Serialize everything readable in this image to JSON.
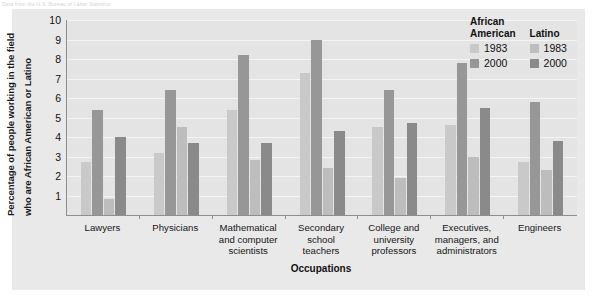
{
  "top_note": "Data from the U.S. Bureau of Labor Statistics",
  "chart_data": {
    "type": "bar",
    "title": "",
    "xlabel": "Occupations",
    "ylabel": "Percentage of people working in the field who are African American or Latino",
    "ylabel_line1": "Percentage of people working in the field",
    "ylabel_line2": "who are African American or Latino",
    "ylim": [
      0,
      10
    ],
    "yticks": [
      10,
      9,
      8,
      7,
      6,
      5,
      4,
      3,
      2,
      1
    ],
    "grid": true,
    "legend_position": "top-right",
    "categories": [
      "Lawyers",
      "Physicians",
      "Mathematical and computer scientists",
      "Secondary school teachers",
      "College and university professors",
      "Executives, managers, and administrators",
      "Engineers"
    ],
    "category_lines": [
      [
        "Lawyers"
      ],
      [
        "Physicians"
      ],
      [
        "Mathematical",
        "and computer",
        "scientists"
      ],
      [
        "Secondary",
        "school",
        "teachers"
      ],
      [
        "College and",
        "university",
        "professors"
      ],
      [
        "Executives,",
        "managers, and",
        "administrators"
      ],
      [
        "Engineers"
      ]
    ],
    "series": [
      {
        "name": "African American 1983",
        "group": "African American",
        "year": "1983",
        "color": "#c9c9c9",
        "values": [
          2.7,
          3.2,
          5.4,
          7.3,
          4.5,
          4.6,
          2.7
        ]
      },
      {
        "name": "African American 2000",
        "group": "African American",
        "year": "2000",
        "color": "#979797",
        "values": [
          5.4,
          6.4,
          8.2,
          9.0,
          6.4,
          7.8,
          5.8
        ]
      },
      {
        "name": "Latino 1983",
        "group": "Latino",
        "year": "1983",
        "color": "#bdbdbd",
        "values": [
          0.8,
          4.5,
          2.8,
          2.4,
          1.9,
          3.0,
          2.3
        ]
      },
      {
        "name": "Latino 2000",
        "group": "Latino",
        "year": "2000",
        "color": "#8a8a8a",
        "values": [
          4.0,
          3.7,
          3.7,
          4.3,
          4.7,
          5.5,
          3.8
        ]
      }
    ]
  },
  "legend": {
    "columns": [
      {
        "header_line1": "African",
        "header_line2": "American",
        "entries": [
          {
            "label": "1983",
            "color": "#c9c9c9"
          },
          {
            "label": "2000",
            "color": "#979797"
          }
        ]
      },
      {
        "header_line1": "",
        "header_line2": "Latino",
        "entries": [
          {
            "label": "1983",
            "color": "#bdbdbd"
          },
          {
            "label": "2000",
            "color": "#8a8a8a"
          }
        ]
      }
    ]
  }
}
